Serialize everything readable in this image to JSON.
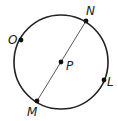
{
  "diagram": {
    "center": {
      "label": "P"
    },
    "points": [
      {
        "label": "N",
        "angle_deg": 56
      },
      {
        "label": "O",
        "angle_deg": 150
      },
      {
        "label": "L",
        "angle_deg": -24
      },
      {
        "label": "M",
        "angle_deg": 236
      }
    ],
    "segments": [
      {
        "from": "M",
        "to": "N",
        "type": "diameter"
      }
    ],
    "colors": {
      "stroke": "#222222",
      "chord": "#444444"
    }
  }
}
